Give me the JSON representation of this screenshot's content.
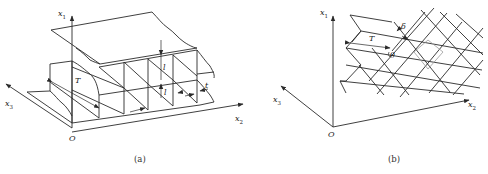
{
  "panel_a": {
    "caption": "(a)",
    "axes": {
      "x1": {
        "base": "x",
        "sub": "1"
      },
      "x2": {
        "base": "x",
        "sub": "2"
      },
      "x3": {
        "base": "x",
        "sub": "3"
      },
      "origin": "O"
    },
    "dimensions": {
      "T": "T",
      "l_vertical": "l",
      "l_horizontal": "l",
      "t": "t"
    }
  },
  "panel_b": {
    "caption": "(b)",
    "axes": {
      "x1": {
        "base": "x",
        "sub": "1"
      },
      "x2": {
        "base": "x",
        "sub": "2"
      },
      "x3": {
        "base": "x",
        "sub": "3"
      },
      "origin": "O"
    },
    "dimensions": {
      "T": "T",
      "delta": "δ",
      "theta": "θ"
    }
  },
  "colors": {
    "line": "#2a2a2a",
    "highlight_line": "#9a9a9a",
    "background": "#ffffff"
  }
}
